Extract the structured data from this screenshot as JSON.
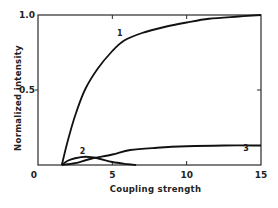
{
  "chart_data": {
    "type": "line",
    "title": "",
    "xlabel": "Coupling strength",
    "ylabel": "Normalized  intensity",
    "xlim": [
      0,
      15
    ],
    "ylim": [
      0,
      1.0
    ],
    "x_ticks": [
      0,
      5,
      10,
      15
    ],
    "x_tick_labels": [
      "0",
      "5",
      "10",
      "15"
    ],
    "y_ticks": [
      0.5,
      1.0
    ],
    "y_tick_labels": [
      "0.5",
      "1.0"
    ],
    "grid": false,
    "legend": "none",
    "series": [
      {
        "name": "1",
        "label_at": [
          5.5,
          0.86
        ],
        "points": [
          [
            1.6,
            0
          ],
          [
            2.0,
            0.16
          ],
          [
            2.5,
            0.33
          ],
          [
            3.15,
            0.5
          ],
          [
            4.0,
            0.64
          ],
          [
            5.0,
            0.76
          ],
          [
            5.8,
            0.83
          ],
          [
            7.0,
            0.88
          ],
          [
            8.5,
            0.92
          ],
          [
            10.0,
            0.95
          ],
          [
            11.5,
            0.975
          ],
          [
            13.5,
            0.99
          ],
          [
            15.0,
            1.0
          ]
        ]
      },
      {
        "name": "2",
        "label_at": [
          3.0,
          0.075
        ],
        "points": [
          [
            1.6,
            0
          ],
          [
            2.0,
            0.028
          ],
          [
            2.5,
            0.045
          ],
          [
            3.2,
            0.055
          ],
          [
            4.0,
            0.045
          ],
          [
            5.0,
            0.02
          ],
          [
            6.0,
            0.006
          ],
          [
            6.6,
            0.0
          ]
        ]
      },
      {
        "name": "3",
        "label_at": [
          14.0,
          0.095
        ],
        "points": [
          [
            1.6,
            0
          ],
          [
            2.5,
            0.012
          ],
          [
            3.5,
            0.04
          ],
          [
            5.0,
            0.07
          ],
          [
            6.2,
            0.1
          ],
          [
            8.0,
            0.115
          ],
          [
            10.0,
            0.125
          ],
          [
            12.5,
            0.13
          ],
          [
            15.0,
            0.13
          ]
        ]
      }
    ]
  }
}
